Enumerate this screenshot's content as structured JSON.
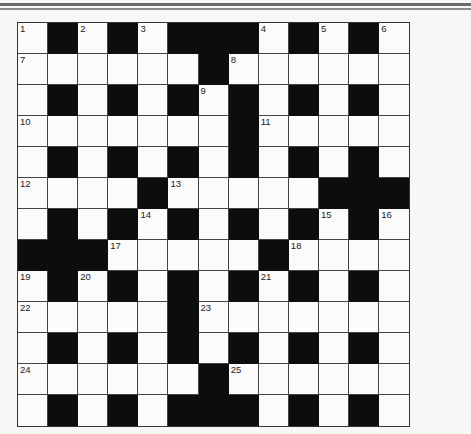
{
  "puzzle": {
    "type": "crossword",
    "rows": 13,
    "cols": 13,
    "grid": [
      "W.W.W...W.W.W",
      "WWWWWW.WWWWWW",
      "W.W.W.W.W.W.W",
      "WWWWWWW.WWWWW",
      "W.W.W.W.W.W.W",
      "WWWW.WWWWW...",
      "W.W.W.W.W.W.W",
      "...WWWWW.WWWW",
      "W.W.W.W.W.W.W",
      "WWWWW.WWWWWWW",
      "W.W.W.W.W.W.W",
      "WWWWWW.WWWWWW",
      "W.W.W...W.W.W"
    ],
    "numbers": [
      {
        "n": "1",
        "r": 0,
        "c": 0
      },
      {
        "n": "2",
        "r": 0,
        "c": 2
      },
      {
        "n": "3",
        "r": 0,
        "c": 4
      },
      {
        "n": "4",
        "r": 0,
        "c": 8
      },
      {
        "n": "5",
        "r": 0,
        "c": 10
      },
      {
        "n": "6",
        "r": 0,
        "c": 12
      },
      {
        "n": "7",
        "r": 1,
        "c": 0
      },
      {
        "n": "8",
        "r": 1,
        "c": 7
      },
      {
        "n": "9",
        "r": 2,
        "c": 6
      },
      {
        "n": "10",
        "r": 3,
        "c": 0
      },
      {
        "n": "11",
        "r": 3,
        "c": 8
      },
      {
        "n": "12",
        "r": 5,
        "c": 0
      },
      {
        "n": "13",
        "r": 5,
        "c": 5
      },
      {
        "n": "14",
        "r": 6,
        "c": 4
      },
      {
        "n": "15",
        "r": 6,
        "c": 10
      },
      {
        "n": "16",
        "r": 6,
        "c": 12
      },
      {
        "n": "17",
        "r": 7,
        "c": 3
      },
      {
        "n": "18",
        "r": 7,
        "c": 9
      },
      {
        "n": "19",
        "r": 8,
        "c": 0
      },
      {
        "n": "20",
        "r": 8,
        "c": 2
      },
      {
        "n": "21",
        "r": 8,
        "c": 8
      },
      {
        "n": "22",
        "r": 9,
        "c": 0
      },
      {
        "n": "23",
        "r": 9,
        "c": 6
      },
      {
        "n": "24",
        "r": 11,
        "c": 0
      },
      {
        "n": "25",
        "r": 11,
        "c": 7
      }
    ],
    "colors": {
      "block": "#0d0d0d",
      "cell": "#fbfbfb",
      "line": "#444444",
      "page": "#f7f7f5"
    }
  }
}
